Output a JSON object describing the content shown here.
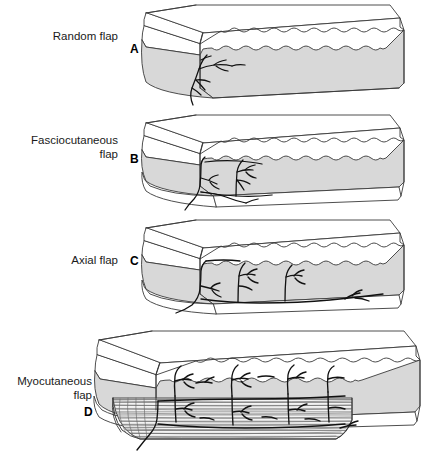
{
  "figure": {
    "kind": "medical-illustration",
    "background_color": "#ffffff",
    "line_color": "#3a3a3a",
    "vessel_color": "#111111",
    "fat_fill": "#d8d8d8",
    "muscle_fill": "#efefef",
    "skin_fill": "#ffffff"
  },
  "panels": [
    {
      "letter": "A",
      "label": "Random flap",
      "label_lines": "Random flap",
      "layers": [
        "skin",
        "subcutaneous fat"
      ],
      "vessel_pattern": "random dendritic vessel entering from base at left",
      "label_x": 46,
      "label_y": 30,
      "letter_x": 131,
      "letter_y": 42
    },
    {
      "letter": "B",
      "label": "Fasciocutaneous flap",
      "label_lines": "Fasciocutaneous\nflap",
      "layers": [
        "skin",
        "subcutaneous fat",
        "fascia"
      ],
      "vessel_pattern": "vessel along fascial plane with ascending perforators",
      "label_x": 14,
      "label_y": 134,
      "letter_x": 131,
      "letter_y": 152
    },
    {
      "letter": "C",
      "label": "Axial flap",
      "label_lines": "Axial flap",
      "layers": [
        "skin",
        "subcutaneous fat",
        "fascia"
      ],
      "vessel_pattern": "long axial vessel running full length with multiple branches",
      "label_x": 55,
      "label_y": 254,
      "letter_x": 131,
      "letter_y": 254
    },
    {
      "letter": "D",
      "label": "Myocutaneous flap",
      "label_lines": "Myocutaneous\nflap",
      "layers": [
        "skin",
        "subcutaneous fat",
        "fascia",
        "muscle"
      ],
      "vessel_pattern": "muscle perforators traversing muscle into overlying skin paddle",
      "label_x": 4,
      "label_y": 375,
      "letter_x": 85,
      "letter_y": 406
    }
  ]
}
